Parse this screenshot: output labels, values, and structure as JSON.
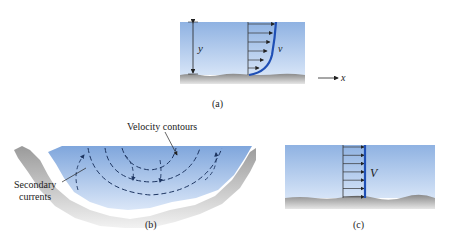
{
  "panels": {
    "a": {
      "caption": "(a)",
      "depth_label": "y",
      "velocity_label": "v",
      "axis_label": "x",
      "description": "Nonuniform velocity profile over depth"
    },
    "b": {
      "caption": "(b)",
      "contours_label": "Velocity contours",
      "secondary_label_line1": "Secondary",
      "secondary_label_line2": "currents",
      "description": "Channel cross-section with velocity contours and secondary currents"
    },
    "c": {
      "caption": "(c)",
      "velocity_label": "V",
      "description": "Uniform velocity profile"
    }
  },
  "colors": {
    "water_top": "#9fbde6",
    "water_bottom": "#dce8f8",
    "ground": "#9a9a9a",
    "profile": "#1f4fb5",
    "ink": "#222222"
  }
}
